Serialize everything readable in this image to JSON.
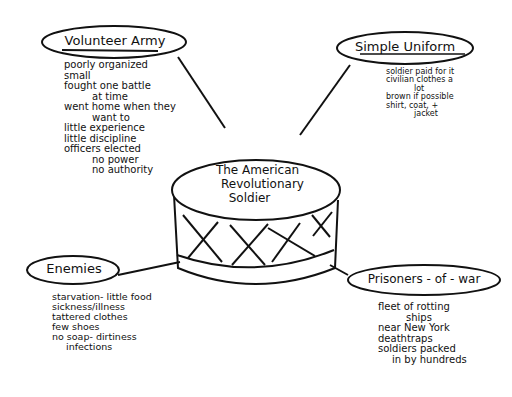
{
  "center": {
    "title_lines": [
      "The American",
      "Revolutionary",
      "Soldier"
    ]
  },
  "nodes": {
    "volunteer_army": {
      "title": "Volunteer Army",
      "notes": [
        "poorly organized",
        "small",
        "fought one battle",
        "at time",
        "went home when they",
        "want to",
        "little experience",
        "little discipline",
        "officers elected",
        "no power",
        "no authority"
      ]
    },
    "simple_uniform": {
      "title": "Simple Uniform",
      "notes": [
        "soldier paid for it",
        "civilian clothes a",
        "lot",
        "brown if possible",
        "shirt, coat, +",
        "jacket"
      ]
    },
    "enemies": {
      "title": "Enemies",
      "notes": [
        "starvation- little food",
        "sickness/illness",
        "tattered clothes",
        "few shoes",
        "no soap- dirtiness",
        "infections"
      ]
    },
    "prisoners_of_war": {
      "title": "Prisoners - of - war",
      "notes": [
        "fleet of rotting",
        "ships",
        "near New York",
        "deathtraps",
        "soldiers packed",
        "in by hundreds"
      ]
    }
  }
}
